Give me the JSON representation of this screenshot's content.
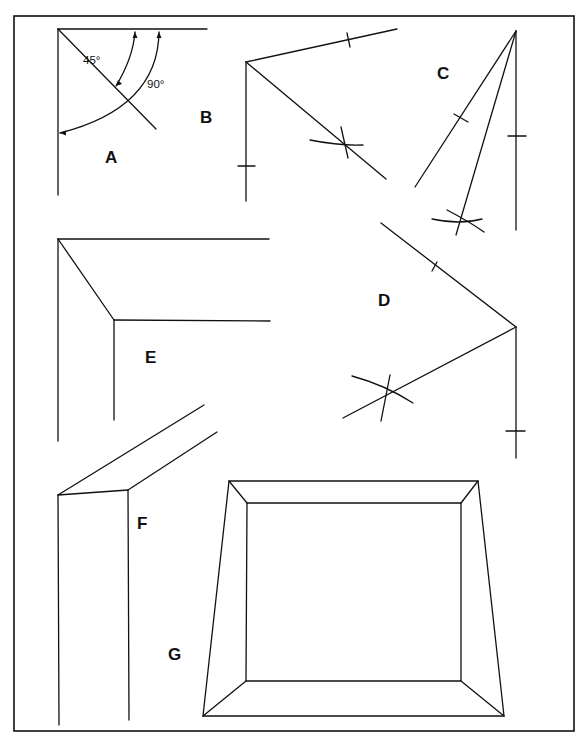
{
  "figure": {
    "background": "#ffffff",
    "ink": "#111111",
    "frame": {
      "x": 14,
      "y": 16,
      "w": 560,
      "h": 715
    }
  },
  "labels": {
    "A": {
      "text": "A",
      "x": 105,
      "y": 163
    },
    "B": {
      "text": "B",
      "x": 200,
      "y": 123
    },
    "C": {
      "text": "C",
      "x": 437,
      "y": 79
    },
    "D": {
      "text": "D",
      "x": 378,
      "y": 306
    },
    "E": {
      "text": "E",
      "x": 145,
      "y": 363
    },
    "F": {
      "text": "F",
      "x": 137,
      "y": 529
    },
    "G": {
      "text": "G",
      "x": 168,
      "y": 660
    }
  },
  "angles": {
    "a45": {
      "text": "45°",
      "x": 83,
      "y": 64
    },
    "a90": {
      "text": "90°",
      "x": 147,
      "y": 88
    }
  },
  "panels": {
    "A": {
      "lines": [
        [
          58,
          29,
          207,
          29
        ],
        [
          58,
          29,
          58,
          195
        ],
        [
          58,
          29,
          156,
          129
        ]
      ],
      "arcs": [
        {
          "d": "M135,32 Q133,58 116,86",
          "arrows": [
            [
              135,
              32,
              "up"
            ],
            [
              116,
              86,
              "down-left"
            ]
          ]
        },
        {
          "d": "M159,32 Q158,108 60,133",
          "arrows": [
            [
              159,
              32,
              "up"
            ],
            [
              60,
              133,
              "left"
            ]
          ]
        }
      ]
    },
    "B": {
      "lines": [
        [
          246,
          62,
          397,
          29
        ],
        [
          246,
          62,
          246,
          201
        ],
        [
          246,
          62,
          386,
          179
        ],
        [
          347,
          33,
          350,
          47
        ],
        [
          238,
          166,
          255,
          166
        ]
      ],
      "construction": [
        "M310,140 Q340,146 363,145",
        "M341,127 L348,158"
      ]
    },
    "C": {
      "lines": [
        [
          516,
          31,
          415,
          187
        ],
        [
          516,
          31,
          456,
          235
        ],
        [
          516,
          31,
          516,
          230
        ],
        [
          508,
          136,
          526,
          136
        ],
        [
          454,
          114,
          468,
          122
        ]
      ],
      "construction": [
        "M432,219 Q460,225 482,219",
        "M447,210 Q470,222 484,232"
      ]
    },
    "D": {
      "lines": [
        [
          381,
          223,
          516,
          327
        ],
        [
          516,
          327,
          343,
          418
        ],
        [
          516,
          327,
          516,
          458
        ],
        [
          432,
          271,
          437,
          262
        ],
        [
          506,
          431,
          525,
          431
        ]
      ],
      "construction": [
        "M352,376 Q385,385 413,403",
        "M390,375 L381,421"
      ]
    },
    "E": {
      "lines": [
        [
          58,
          239,
          269,
          239
        ],
        [
          58,
          239,
          58,
          441
        ],
        [
          58,
          239,
          114,
          320
        ],
        [
          114,
          320,
          270,
          321
        ],
        [
          114,
          320,
          114,
          420
        ]
      ]
    },
    "F": {
      "lines": [
        [
          58,
          495,
          204,
          405
        ],
        [
          58,
          495,
          128,
          490
        ],
        [
          128,
          490,
          217,
          432
        ],
        [
          58,
          495,
          59,
          725
        ],
        [
          128,
          490,
          129,
          720
        ]
      ]
    },
    "G": {
      "outer": [
        [
          229,
          481
        ],
        [
          478,
          481
        ],
        [
          504,
          716
        ],
        [
          203,
          716
        ]
      ],
      "inner": [
        [
          247,
          503
        ],
        [
          461,
          503
        ],
        [
          461,
          681
        ],
        [
          246,
          681
        ]
      ]
    }
  }
}
